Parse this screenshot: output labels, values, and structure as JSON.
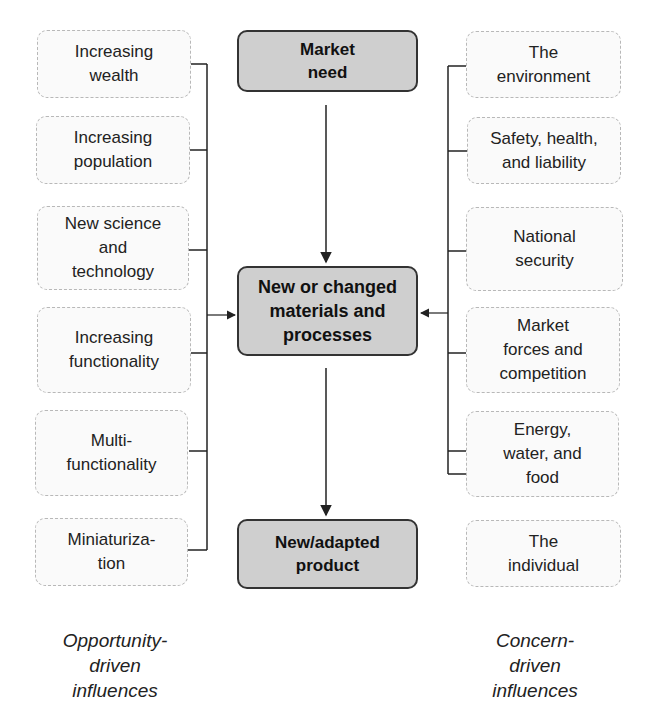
{
  "center": {
    "market_need": "Market\nneed",
    "materials": "New or changed\nmaterials and\nprocesses",
    "product": "New/adapted\nproduct"
  },
  "left": {
    "items": [
      "Increasing\nwealth",
      "Increasing\npopulation",
      "New science\nand\ntechnology",
      "Increasing\nfunctionality",
      "Multi-\nfunctionality",
      "Miniaturiza-\ntion"
    ],
    "caption": "Opportunity-\ndriven\ninfluences"
  },
  "right": {
    "items": [
      "The\nenvironment",
      "Safety, health,\nand liability",
      "National\nsecurity",
      "Market\nforces and\ncompetition",
      "Energy,\nwater, and\nfood",
      "The\nindividual"
    ],
    "caption": "Concern-\ndriven\ninfluences"
  },
  "colors": {
    "center_fill": "#cfcfcf",
    "side_border": "#b8b8b8",
    "line": "#222222"
  }
}
